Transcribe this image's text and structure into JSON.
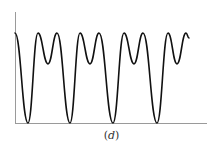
{
  "figure": {
    "caption_open": "(",
    "caption_letter": "d",
    "caption_close": ")",
    "axis_color": "#9a9a9a",
    "curve_color": "#111111"
  },
  "chart_data": {
    "type": "line",
    "title": "",
    "caption": "(d)",
    "xlabel": "",
    "ylabel": "",
    "grid": false,
    "legend": null,
    "axes": {
      "x_ticks": [],
      "y_ticks": []
    },
    "series": [
      {
        "name": "waveform",
        "points_px": [
          [
            15,
            33
          ],
          [
            28,
            123
          ],
          [
            38,
            33
          ],
          [
            48,
            64
          ],
          [
            57,
            33
          ],
          [
            70,
            123
          ],
          [
            80,
            33
          ],
          [
            90,
            64
          ],
          [
            99,
            33
          ],
          [
            113,
            123
          ],
          [
            124,
            33
          ],
          [
            134,
            64
          ],
          [
            143,
            33
          ],
          [
            157,
            123
          ],
          [
            168,
            33
          ],
          [
            177,
            64
          ],
          [
            186,
            33
          ],
          [
            189,
            38
          ]
        ],
        "relative_levels": {
          "minimum": 0.0,
          "peak": 1.0,
          "mid_dip": 0.66
        }
      }
    ]
  }
}
